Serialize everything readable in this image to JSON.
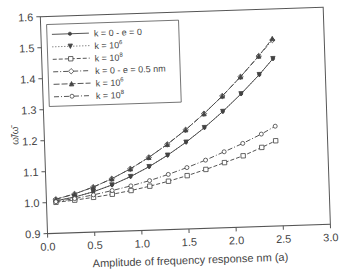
{
  "chart_data": {
    "type": "line",
    "title": "",
    "xlabel": "Amplitude of frequency response nm (a)",
    "ylabel": "ω̃/ω̄",
    "xlim": [
      0.0,
      3.0
    ],
    "ylim": [
      0.9,
      1.6
    ],
    "xticks": [
      "0.0",
      "0.5",
      "1.0",
      "1.5",
      "2.0",
      "2.5",
      "3.0"
    ],
    "yticks": [
      "0.9",
      "1.0",
      "1.1",
      "1.2",
      "1.3",
      "1.4",
      "1.5",
      "1.6"
    ],
    "grid": false,
    "legend_position": "upper-left",
    "x": [
      0.1,
      0.3,
      0.5,
      0.7,
      0.9,
      1.1,
      1.3,
      1.5,
      1.7,
      1.9,
      2.1,
      2.3,
      2.45
    ],
    "series": [
      {
        "name": "k = 0 - e = 0",
        "style": "solid",
        "marker": "dot",
        "values": [
          1.005,
          1.015,
          1.03,
          1.05,
          1.075,
          1.105,
          1.14,
          1.18,
          1.225,
          1.275,
          1.33,
          1.39,
          1.44
        ]
      },
      {
        "name": "k = 10^6",
        "style": "dotted",
        "marker": "triangle-down",
        "values": [
          1.005,
          1.015,
          1.03,
          1.05,
          1.075,
          1.105,
          1.14,
          1.18,
          1.225,
          1.275,
          1.33,
          1.39,
          1.44
        ]
      },
      {
        "name": "k = 10^8",
        "style": "dashed",
        "marker": "open-square",
        "values": [
          1.0,
          1.005,
          1.012,
          1.02,
          1.03,
          1.042,
          1.056,
          1.072,
          1.09,
          1.11,
          1.13,
          1.155,
          1.175
        ]
      },
      {
        "name": "k = 0 - e = 0.5 nm",
        "style": "dash-dot",
        "marker": "open-diamond",
        "values": [
          1.01,
          1.025,
          1.045,
          1.07,
          1.1,
          1.135,
          1.175,
          1.22,
          1.27,
          1.325,
          1.385,
          1.45,
          1.5
        ]
      },
      {
        "name": "k = 10^6",
        "style": "long-dash",
        "marker": "filled-triangle",
        "values": [
          1.01,
          1.025,
          1.045,
          1.07,
          1.1,
          1.135,
          1.175,
          1.22,
          1.27,
          1.325,
          1.385,
          1.45,
          1.505
        ]
      },
      {
        "name": "k = 10^8",
        "style": "dash-dot",
        "marker": "open-circle",
        "values": [
          1.002,
          1.01,
          1.02,
          1.032,
          1.045,
          1.06,
          1.078,
          1.098,
          1.12,
          1.145,
          1.17,
          1.198,
          1.222
        ]
      }
    ]
  },
  "legend": {
    "items": [
      {
        "prefix": "k = 0 - e = 0",
        "base": "",
        "exp": ""
      },
      {
        "prefix": "k = ",
        "base": "10",
        "exp": "6"
      },
      {
        "prefix": "k = ",
        "base": "10",
        "exp": "8"
      },
      {
        "prefix": "k = 0 - e = 0.5 nm",
        "base": "",
        "exp": ""
      },
      {
        "prefix": "k = ",
        "base": "10",
        "exp": "6"
      },
      {
        "prefix": "k = ",
        "base": "10",
        "exp": "8"
      }
    ]
  },
  "colors": {
    "axis": "#555555",
    "line": "#444444",
    "text": "#444444"
  }
}
